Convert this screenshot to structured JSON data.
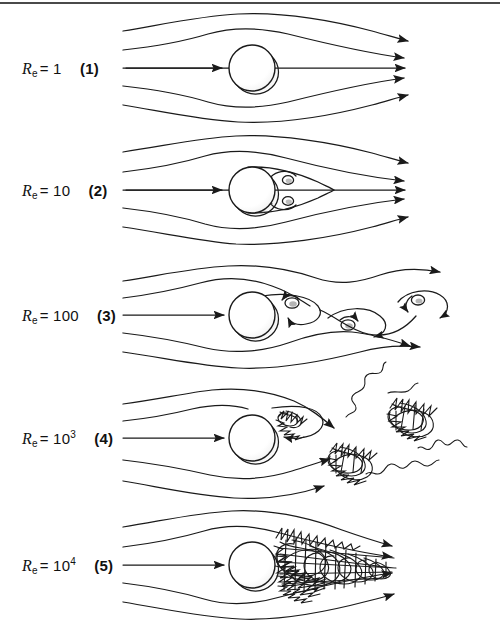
{
  "figure": {
    "top_rule_color": "#4a4a4a",
    "background": "#ffffff",
    "line_color": "#1a1a1a",
    "sphere_fill": "#ffffff",
    "sphere_stroke": "#1a1a1a",
    "shadow_color": "#9a9a9a"
  },
  "rows": [
    {
      "id": "row-re-1",
      "symbol": "R",
      "subscript": "e",
      "equals": "=",
      "value": "1",
      "superscript": "",
      "index": "(1)",
      "regime": "creeping-laminar-attached-flow",
      "description": "Symmetric streamlines, no separation",
      "center_y": 68,
      "sphere_cx": 252,
      "sphere_r": 23,
      "streamline_count": 5,
      "features": [
        "symmetric-streamlines",
        "no-wake"
      ]
    },
    {
      "id": "row-re-10",
      "symbol": "R",
      "subscript": "e",
      "equals": "=",
      "value": "10",
      "superscript": "",
      "index": "(2)",
      "regime": "steady-separated-vortex-pair",
      "description": "Attached symmetric standing eddy pair behind sphere",
      "center_y": 190,
      "sphere_cx": 252,
      "sphere_r": 23,
      "streamline_count": 5,
      "features": [
        "twin-standing-vortices",
        "teardrop-wake-envelope"
      ]
    },
    {
      "id": "row-re-100",
      "symbol": "R",
      "subscript": "e",
      "equals": "=",
      "value": "100",
      "superscript": "",
      "index": "(3)",
      "regime": "periodic-vortex-shedding",
      "description": "Alternating von Karman vortex street",
      "center_y": 315,
      "sphere_cx": 252,
      "sphere_r": 23,
      "streamline_count": 5,
      "features": [
        "shed-vortices",
        "wavy-streamlines",
        "alternating-rotation"
      ]
    },
    {
      "id": "row-re-1000",
      "symbol": "R",
      "subscript": "e",
      "equals": "=",
      "value": "10",
      "superscript": "3",
      "index": "(4)",
      "regime": "turbulent-eddy-shedding",
      "description": "Discrete turbulent eddies detach and drift downstream",
      "center_y": 438,
      "sphere_cx": 252,
      "sphere_r": 23,
      "streamline_count": 5,
      "features": [
        "turbulent-blobs",
        "squiggle-trails",
        "recirculation-loop"
      ]
    },
    {
      "id": "row-re-10000",
      "symbol": "R",
      "subscript": "e",
      "equals": "=",
      "value": "10",
      "superscript": "4",
      "index": "(5)",
      "regime": "fully-turbulent-wake",
      "description": "Continuous dense turbulent wake attached to sphere",
      "center_y": 565,
      "sphere_cx": 252,
      "sphere_r": 23,
      "streamline_count": 5,
      "features": [
        "dense-turbulent-wake",
        "tapering-wake-cone"
      ]
    }
  ]
}
